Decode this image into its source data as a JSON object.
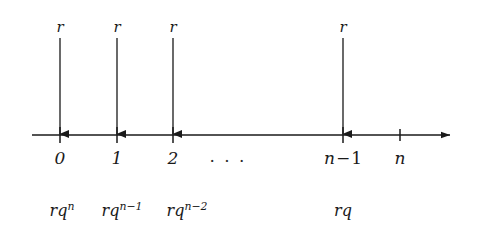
{
  "figure": {
    "type": "number-line-cashflow-diagram",
    "background_color": "#ffffff",
    "ink_color": "#1a1a1a",
    "axis": {
      "y": 135,
      "x_start": 32,
      "x_end": 455,
      "has_right_arrowhead": true
    },
    "payment_arrows": [
      {
        "x": 60,
        "label": "r",
        "label_y": 30,
        "top_y": 38,
        "bottom_y": 135
      },
      {
        "x": 117,
        "label": "r",
        "label_y": 30,
        "top_y": 38,
        "bottom_y": 135
      },
      {
        "x": 173,
        "label": "r",
        "label_y": 30,
        "top_y": 38,
        "bottom_y": 135
      },
      {
        "x": 343,
        "label": "r",
        "label_y": 30,
        "top_y": 38,
        "bottom_y": 135
      }
    ],
    "ticks": [
      {
        "x": 60,
        "kind": "arrow-tick",
        "half_height": 8
      },
      {
        "x": 117,
        "kind": "arrow-tick",
        "half_height": 8
      },
      {
        "x": 173,
        "kind": "arrow-tick",
        "half_height": 8
      },
      {
        "x": 343,
        "kind": "arrow-tick",
        "half_height": 8
      },
      {
        "x": 400,
        "kind": "plain-tick",
        "half_height": 6
      }
    ],
    "index_labels": [
      {
        "x": 60,
        "y": 155,
        "text": "0"
      },
      {
        "x": 117,
        "y": 155,
        "text": "1"
      },
      {
        "x": 173,
        "y": 155,
        "text": "2"
      },
      {
        "x": 343,
        "y": 155,
        "text_prefix": "n",
        "text_operator": "−",
        "text_suffix": "1"
      },
      {
        "x": 400,
        "y": 155,
        "text": "n"
      }
    ],
    "ellipsis": {
      "x": 228,
      "y": 158,
      "text": "· · ·"
    },
    "value_labels": [
      {
        "x": 62,
        "y": 207,
        "base": "rq",
        "exponent": "n"
      },
      {
        "x": 122,
        "y": 207,
        "base": "rq",
        "exponent": "n−1"
      },
      {
        "x": 187,
        "y": 207,
        "base": "rq",
        "exponent": "n−2"
      },
      {
        "x": 343,
        "y": 207,
        "base": "rq",
        "exponent": ""
      }
    ],
    "labels": {
      "payment_r": "r",
      "index_0": "0",
      "index_1": "1",
      "index_2": "2",
      "index_n_minus_1_base": "n",
      "index_n_minus_1_op": "−",
      "index_n_minus_1_tail": "1",
      "index_n": "n",
      "ellipsis": "· · ·",
      "value_rq_base": "rq",
      "value_exp_n": "n",
      "value_exp_n_minus_1": "n−1",
      "value_exp_n_minus_2": "n−2",
      "value_rq_plain": "rq"
    }
  }
}
